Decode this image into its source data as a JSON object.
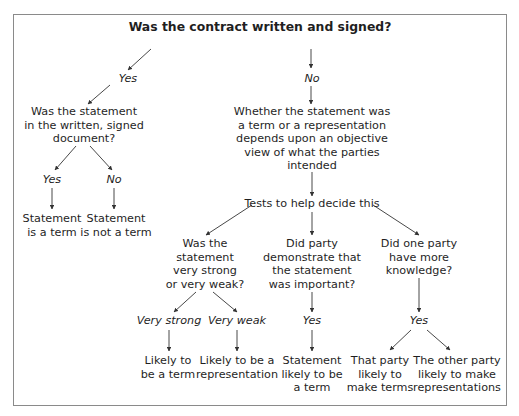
{
  "diagram": {
    "title": "Was the contract written and signed?",
    "branches": {
      "yes_label": "Yes",
      "no_label": "No"
    },
    "written_branch": {
      "question": [
        "Was the statement",
        "in the written, signed",
        "document?"
      ],
      "yes_label": "Yes",
      "no_label": "No",
      "yes_outcome": [
        "Statement",
        "is a term"
      ],
      "no_outcome": [
        "Statement",
        "is not a term"
      ]
    },
    "unwritten_branch": {
      "explanation": [
        "Whether the statement was",
        "a term or a representation",
        "depends upon an objective",
        "view of what the parties",
        "intended"
      ],
      "tests_label": "Tests to help decide this",
      "tests": [
        {
          "question": [
            "Was the",
            "statement",
            "very strong",
            "or very weak?"
          ],
          "answers": [
            {
              "label": "Very strong",
              "outcome": [
                "Likely to",
                "be a term"
              ]
            },
            {
              "label": "Very weak",
              "outcome": [
                "Likely to be a",
                "representation"
              ]
            }
          ]
        },
        {
          "question": [
            "Did party",
            "demonstrate that",
            "the statement",
            "was important?"
          ],
          "answers": [
            {
              "label": "Yes",
              "outcome": [
                "Statement",
                "likely to be",
                "a term"
              ]
            }
          ]
        },
        {
          "question": [
            "Did one party",
            "have more",
            "knowledge?"
          ],
          "answer_label": "Yes",
          "outcomes": [
            [
              "That party",
              "likely to",
              "make terms"
            ],
            [
              "The other party",
              "likely to make",
              "representations"
            ]
          ]
        }
      ]
    },
    "colors": {
      "frame": "#8a8a8a",
      "arrow": "#333333",
      "text": "#1f1f1f"
    }
  }
}
